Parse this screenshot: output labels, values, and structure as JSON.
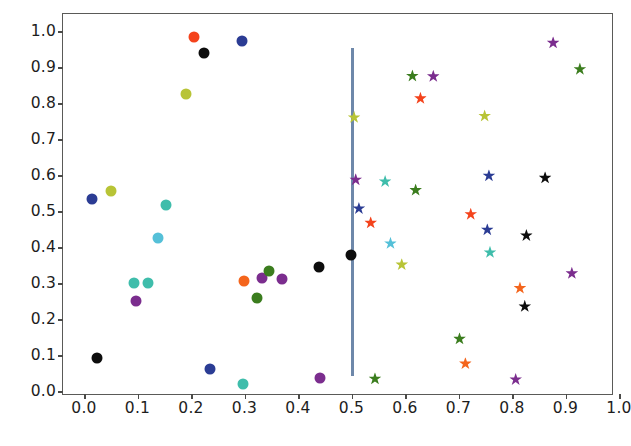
{
  "chart_data": {
    "type": "scatter",
    "title": "",
    "xlabel": "",
    "ylabel": "",
    "xlim": [
      0.0,
      1.0
    ],
    "ylim": [
      0.0,
      1.0
    ],
    "grid": false,
    "legend": null,
    "x_ticks": [
      "0.0",
      "0.1",
      "0.2",
      "0.3",
      "0.4",
      "0.5",
      "0.6",
      "0.7",
      "0.8",
      "0.9",
      "1.0"
    ],
    "y_ticks": [
      "0.0",
      "0.1",
      "0.2",
      "0.3",
      "0.4",
      "0.5",
      "0.6",
      "0.7",
      "0.8",
      "0.9",
      "1.0"
    ],
    "x_tick_values": [
      0.0,
      0.1,
      0.2,
      0.3,
      0.4,
      0.5,
      0.6,
      0.7,
      0.8,
      0.9,
      1.0
    ],
    "y_tick_values": [
      0.0,
      0.1,
      0.2,
      0.3,
      0.4,
      0.5,
      0.6,
      0.7,
      0.8,
      0.9,
      1.0
    ],
    "annotations": [
      {
        "name": "vertical-threshold-line",
        "type": "vline",
        "x": 0.5,
        "y_start": 0.045,
        "y_end": 0.955,
        "color": "#6e88aa",
        "width": 2.2
      }
    ],
    "series": [
      {
        "name": "left-group-circles",
        "marker": "o",
        "size": 11,
        "points": [
          {
            "x": 0.013,
            "y": 0.535,
            "color": "#2b3c94"
          },
          {
            "x": 0.022,
            "y": 0.094,
            "color": "#0d0d0d"
          },
          {
            "x": 0.048,
            "y": 0.558,
            "color": "#b8c436"
          },
          {
            "x": 0.091,
            "y": 0.304,
            "color": "#3fbdab"
          },
          {
            "x": 0.096,
            "y": 0.252,
            "color": "#7b2d8e"
          },
          {
            "x": 0.117,
            "y": 0.304,
            "color": "#3fbdab"
          },
          {
            "x": 0.137,
            "y": 0.428,
            "color": "#55c0d8"
          },
          {
            "x": 0.152,
            "y": 0.519,
            "color": "#3fbdab"
          },
          {
            "x": 0.188,
            "y": 0.827,
            "color": "#b8c436"
          },
          {
            "x": 0.203,
            "y": 0.986,
            "color": "#f4431c"
          },
          {
            "x": 0.223,
            "y": 0.943,
            "color": "#0d0d0d"
          },
          {
            "x": 0.233,
            "y": 0.064,
            "color": "#2b3c94"
          },
          {
            "x": 0.293,
            "y": 0.976,
            "color": "#2b3c94"
          },
          {
            "x": 0.296,
            "y": 0.023,
            "color": "#3fbdab"
          },
          {
            "x": 0.298,
            "y": 0.307,
            "color": "#f4651c"
          },
          {
            "x": 0.321,
            "y": 0.262,
            "color": "#3b7d1e"
          },
          {
            "x": 0.33,
            "y": 0.316,
            "color": "#7b2d8e"
          },
          {
            "x": 0.344,
            "y": 0.337,
            "color": "#3b7d1e"
          },
          {
            "x": 0.369,
            "y": 0.313,
            "color": "#7b2d8e"
          },
          {
            "x": 0.437,
            "y": 0.346,
            "color": "#0d0d0d"
          },
          {
            "x": 0.44,
            "y": 0.04,
            "color": "#7b2d8e"
          },
          {
            "x": 0.497,
            "y": 0.38,
            "color": "#0d0d0d"
          }
        ]
      },
      {
        "name": "right-group-stars",
        "marker": "*",
        "size": 13,
        "points": [
          {
            "x": 0.503,
            "y": 0.763,
            "color": "#b8c436"
          },
          {
            "x": 0.506,
            "y": 0.59,
            "color": "#7b2d8e"
          },
          {
            "x": 0.512,
            "y": 0.51,
            "color": "#2b3c94"
          },
          {
            "x": 0.534,
            "y": 0.47,
            "color": "#f4431c"
          },
          {
            "x": 0.542,
            "y": 0.037,
            "color": "#3b7d1e"
          },
          {
            "x": 0.561,
            "y": 0.585,
            "color": "#3fbdab"
          },
          {
            "x": 0.571,
            "y": 0.413,
            "color": "#55c0d8"
          },
          {
            "x": 0.592,
            "y": 0.354,
            "color": "#b8c436"
          },
          {
            "x": 0.612,
            "y": 0.878,
            "color": "#3b7d1e"
          },
          {
            "x": 0.618,
            "y": 0.561,
            "color": "#3b7d1e"
          },
          {
            "x": 0.627,
            "y": 0.816,
            "color": "#f4431c"
          },
          {
            "x": 0.651,
            "y": 0.877,
            "color": "#7b2d8e"
          },
          {
            "x": 0.7,
            "y": 0.148,
            "color": "#3b7d1e"
          },
          {
            "x": 0.711,
            "y": 0.079,
            "color": "#f4651c"
          },
          {
            "x": 0.721,
            "y": 0.494,
            "color": "#f4431c"
          },
          {
            "x": 0.747,
            "y": 0.767,
            "color": "#b8c436"
          },
          {
            "x": 0.752,
            "y": 0.451,
            "color": "#2b3c94"
          },
          {
            "x": 0.755,
            "y": 0.601,
            "color": "#2b3c94"
          },
          {
            "x": 0.757,
            "y": 0.388,
            "color": "#3fbdab"
          },
          {
            "x": 0.805,
            "y": 0.035,
            "color": "#7b2d8e"
          },
          {
            "x": 0.813,
            "y": 0.289,
            "color": "#f4651c"
          },
          {
            "x": 0.822,
            "y": 0.238,
            "color": "#0d0d0d"
          },
          {
            "x": 0.825,
            "y": 0.435,
            "color": "#0d0d0d"
          },
          {
            "x": 0.86,
            "y": 0.595,
            "color": "#0d0d0d"
          },
          {
            "x": 0.875,
            "y": 0.97,
            "color": "#7b2d8e"
          },
          {
            "x": 0.91,
            "y": 0.33,
            "color": "#7b2d8e"
          },
          {
            "x": 0.925,
            "y": 0.897,
            "color": "#3b7d1e"
          }
        ]
      }
    ]
  },
  "style": {
    "frame_color": "#5a5a58",
    "tick_label_color": "#1d1d1d",
    "background": "#ffffff"
  }
}
